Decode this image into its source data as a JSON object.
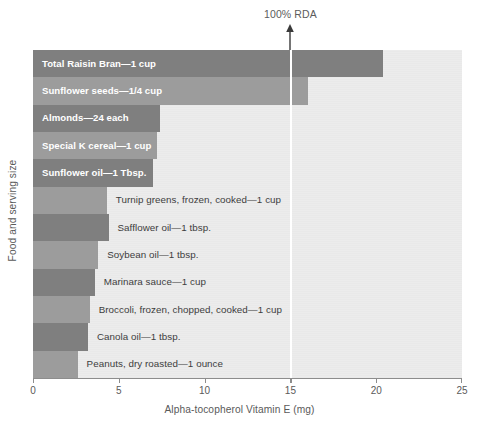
{
  "chart_data": {
    "type": "bar",
    "orientation": "horizontal",
    "title": "",
    "xlabel": "Alpha-tocopherol Vitamin E (mg)",
    "ylabel": "Food and serving size",
    "xlim": [
      0,
      25
    ],
    "xticks": [
      0,
      5,
      10,
      15,
      20,
      25
    ],
    "xtick_labels": [
      "0",
      "5",
      "10",
      "15",
      "20",
      "25"
    ],
    "grid": false,
    "legend": null,
    "annotations": [
      {
        "text": "100% RDA",
        "x": 15,
        "type": "arrow-marker",
        "note": "upward arrow pointing to vertical white reference line at 15 mg"
      }
    ],
    "categories": [
      "Total Raisin Bran—1 cup",
      "Sunflower seeds—1/4 cup",
      "Almonds—24 each",
      "Special K cereal—1 cup",
      "Sunflower oil—1 Tbsp.",
      "Turnip greens, frozen, cooked—1 cup",
      "Safflower oil—1 tbsp.",
      "Soybean oil—1 tbsp.",
      "Marinara sauce—1 cup",
      "Broccoli, frozen, chopped, cooked—1 cup",
      "Canola oil—1 tbsp.",
      "Peanuts, dry roasted—1 ounce"
    ],
    "values": [
      20.4,
      16.0,
      7.4,
      7.2,
      7.0,
      4.3,
      4.4,
      3.8,
      3.6,
      3.3,
      3.2,
      2.6
    ],
    "label_placement": [
      "inside",
      "inside",
      "inside",
      "inside",
      "inside",
      "outside",
      "outside",
      "outside",
      "outside",
      "outside",
      "outside",
      "outside"
    ]
  },
  "colors": {
    "plot_background": "#ececec",
    "bar_dark": "#7f7f7f",
    "bar_light": "#9c9c9c",
    "axis": "#8d8d8d",
    "text": "#5a5a5a",
    "inside_label": "#ffffff",
    "reference_line": "#ffffff",
    "page_background": "#ffffff"
  },
  "axis": {
    "x_title": "Alpha-tocopherol Vitamin E (mg)",
    "y_title": "Food and serving size",
    "x_ticks": [
      "0",
      "5",
      "10",
      "15",
      "20",
      "25"
    ]
  },
  "annotation": {
    "rda_text": "100% RDA",
    "rda_value": 15
  }
}
